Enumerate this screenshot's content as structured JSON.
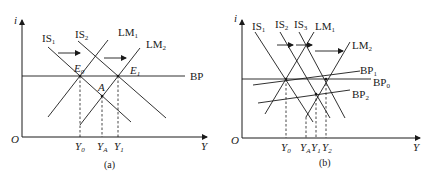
{
  "panels": [
    {
      "id": "a",
      "caption": "(a)",
      "y_axis_label": "i",
      "x_axis_label": "Y",
      "origin_label": "O",
      "curves": {
        "IS1": {
          "base": "IS",
          "sub": "1"
        },
        "IS2": {
          "base": "IS",
          "sub": "2"
        },
        "LM1": {
          "base": "LM",
          "sub": "1"
        },
        "LM2": {
          "base": "LM",
          "sub": "2"
        },
        "BP": {
          "base": "BP",
          "sub": ""
        }
      },
      "points": {
        "E0": {
          "base": "E",
          "sub": "0"
        },
        "E1": {
          "base": "E",
          "sub": "1"
        },
        "A": {
          "base": "A",
          "sub": ""
        }
      },
      "x_ticks": [
        {
          "base": "Y",
          "sub": "0"
        },
        {
          "base": "Y",
          "sub": "A"
        },
        {
          "base": "Y",
          "sub": "1"
        }
      ]
    },
    {
      "id": "b",
      "caption": "(b)",
      "y_axis_label": "i",
      "x_axis_label": "Y",
      "origin_label": "O",
      "curves": {
        "IS1": {
          "base": "IS",
          "sub": "1"
        },
        "IS2": {
          "base": "IS",
          "sub": "2"
        },
        "IS3": {
          "base": "IS",
          "sub": "3"
        },
        "LM1": {
          "base": "LM",
          "sub": "1"
        },
        "LM2": {
          "base": "LM",
          "sub": "2"
        },
        "BP0": {
          "base": "BP",
          "sub": "0"
        },
        "BP1": {
          "base": "BP",
          "sub": "1"
        },
        "BP2": {
          "base": "BP",
          "sub": "2"
        }
      },
      "x_ticks": [
        {
          "base": "Y",
          "sub": "0"
        },
        {
          "base": "Y",
          "sub": "A"
        },
        {
          "base": "Y",
          "sub": "1"
        },
        {
          "base": "Y",
          "sub": "2"
        }
      ]
    }
  ]
}
